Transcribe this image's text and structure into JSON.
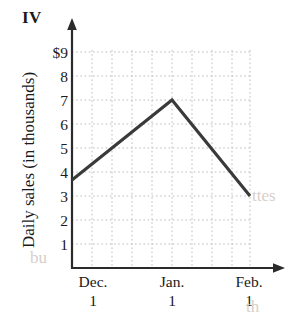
{
  "figure": {
    "label": "IV"
  },
  "artifacts": [
    {
      "text": "bu",
      "x": 30,
      "y": 248
    },
    {
      "text": "ttes",
      "x": 252,
      "y": 186
    },
    {
      "text": "th",
      "x": 246,
      "y": 297
    }
  ],
  "chart_data": {
    "type": "line",
    "title": "IV",
    "xlabel": "",
    "ylabel": "Daily sales (in thousands)",
    "x_tick_labels": [
      "Dec. 1",
      "Jan. 1",
      "Feb. 1"
    ],
    "x_tick_month": [
      "Dec.",
      "Jan.",
      "Feb."
    ],
    "x_tick_day": [
      "1",
      "1",
      "1"
    ],
    "y_tick_labels": [
      "$9",
      "8",
      "7",
      "6",
      "5",
      "4",
      "3",
      "2",
      "1"
    ],
    "y_tick_values": [
      9,
      8,
      7,
      6,
      5,
      4,
      3,
      2,
      1
    ],
    "ylim": [
      0,
      9.3
    ],
    "xlim": [
      0,
      9
    ],
    "grid": true,
    "grid_style": "dotted",
    "legend": "none",
    "series": [
      {
        "name": "Daily sales",
        "points": [
          {
            "x": 1.0,
            "y": 3.7,
            "label": "start of axis"
          },
          {
            "x": 6.0,
            "y": 7.0,
            "label": "Jan. 1 peak"
          },
          {
            "x": 9.0,
            "y": 3.0,
            "label": "Feb. 1"
          }
        ],
        "values": [
          3.7,
          7.0,
          3.0
        ],
        "color": "#3a3a3a",
        "line_width": 3
      }
    ],
    "x_tick_positions": [
      2,
      6,
      9
    ]
  },
  "colors": {
    "line": "#3a3a3a",
    "axis": "#2b2b2b",
    "grid": "#b9b9b9",
    "text": "#1a1a1a",
    "background": "#ffffff"
  }
}
